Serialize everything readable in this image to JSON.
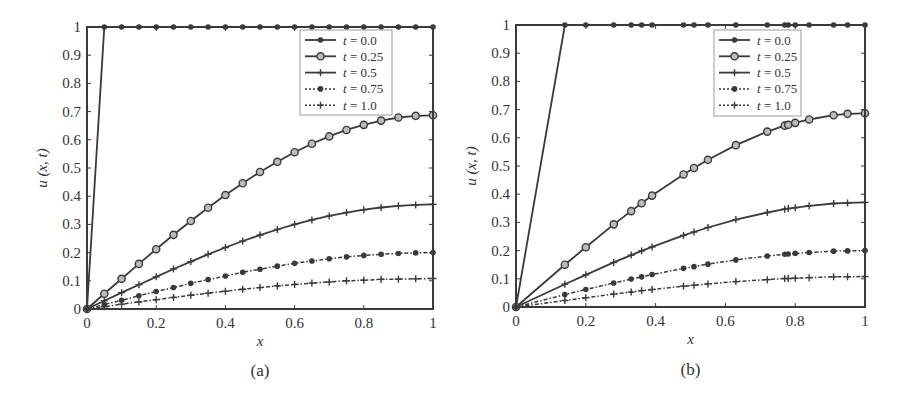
{
  "chart_data": [
    {
      "type": "line",
      "panel": "a",
      "caption": "(a)",
      "xlabel": "x",
      "ylabel": "u (x, t)",
      "xlim": [
        0,
        1
      ],
      "ylim": [
        0,
        1
      ],
      "xticks": [
        "0",
        "0.2",
        "0.4",
        "0.6",
        "0.8",
        "1"
      ],
      "yticks": [
        "0",
        "0.1",
        "0.2",
        "0.3",
        "0.4",
        "0.5",
        "0.6",
        "0.7",
        "0.8",
        "0.9",
        "1"
      ],
      "grid": false,
      "legend_position": "upper right",
      "series": [
        {
          "name": "t = 0.0",
          "style": "solid",
          "marker": "dot",
          "x": [
            0,
            0.05,
            0.1,
            0.15,
            0.2,
            0.25,
            0.3,
            0.35,
            0.4,
            0.45,
            0.5,
            0.55,
            0.6,
            0.65,
            0.7,
            0.75,
            0.8,
            0.85,
            0.9,
            0.95,
            1
          ],
          "values": [
            0,
            1,
            1,
            1,
            1,
            1,
            1,
            1,
            1,
            1,
            1,
            1,
            1,
            1,
            1,
            1,
            1,
            1,
            1,
            1,
            1
          ]
        },
        {
          "name": "t = 0.25",
          "style": "solid",
          "marker": "circle",
          "x": [
            0,
            0.05,
            0.1,
            0.15,
            0.2,
            0.25,
            0.3,
            0.35,
            0.4,
            0.45,
            0.5,
            0.55,
            0.6,
            0.65,
            0.7,
            0.75,
            0.8,
            0.85,
            0.9,
            0.95,
            1
          ],
          "values": [
            0,
            0.054,
            0.107,
            0.16,
            0.212,
            0.263,
            0.312,
            0.359,
            0.404,
            0.446,
            0.486,
            0.522,
            0.556,
            0.586,
            0.612,
            0.635,
            0.653,
            0.668,
            0.679,
            0.685,
            0.687
          ]
        },
        {
          "name": "t = 0.5",
          "style": "solid",
          "marker": "plus",
          "x": [
            0,
            0.05,
            0.1,
            0.15,
            0.2,
            0.25,
            0.3,
            0.35,
            0.4,
            0.45,
            0.5,
            0.55,
            0.6,
            0.65,
            0.7,
            0.75,
            0.8,
            0.85,
            0.9,
            0.95,
            1
          ],
          "values": [
            0,
            0.029,
            0.058,
            0.086,
            0.114,
            0.142,
            0.168,
            0.194,
            0.218,
            0.241,
            0.262,
            0.282,
            0.3,
            0.316,
            0.33,
            0.342,
            0.352,
            0.36,
            0.366,
            0.369,
            0.371
          ]
        },
        {
          "name": "t = 0.75",
          "style": "dashdot",
          "marker": "dot",
          "x": [
            0,
            0.05,
            0.1,
            0.15,
            0.2,
            0.25,
            0.3,
            0.35,
            0.4,
            0.45,
            0.5,
            0.55,
            0.6,
            0.65,
            0.7,
            0.75,
            0.8,
            0.85,
            0.9,
            0.95,
            1
          ],
          "values": [
            0,
            0.016,
            0.031,
            0.047,
            0.062,
            0.076,
            0.091,
            0.104,
            0.117,
            0.13,
            0.141,
            0.152,
            0.162,
            0.17,
            0.178,
            0.185,
            0.19,
            0.194,
            0.197,
            0.199,
            0.2
          ]
        },
        {
          "name": "t = 1.0",
          "style": "dashdot",
          "marker": "plus",
          "x": [
            0,
            0.05,
            0.1,
            0.15,
            0.2,
            0.25,
            0.3,
            0.35,
            0.4,
            0.45,
            0.5,
            0.55,
            0.6,
            0.65,
            0.7,
            0.75,
            0.8,
            0.85,
            0.9,
            0.95,
            1
          ],
          "values": [
            0,
            0.008,
            0.017,
            0.025,
            0.033,
            0.041,
            0.049,
            0.056,
            0.063,
            0.07,
            0.076,
            0.082,
            0.087,
            0.092,
            0.096,
            0.1,
            0.102,
            0.105,
            0.106,
            0.107,
            0.108
          ]
        }
      ]
    },
    {
      "type": "line",
      "panel": "b",
      "caption": "(b)",
      "xlabel": "x",
      "ylabel": "u (x, t)",
      "xlim": [
        0,
        1
      ],
      "ylim": [
        0,
        1
      ],
      "xticks": [
        "0",
        "0.2",
        "0.4",
        "0.6",
        "0.8",
        "1"
      ],
      "yticks": [
        "0",
        "0.1",
        "0.2",
        "0.3",
        "0.4",
        "0.5",
        "0.6",
        "0.7",
        "0.8",
        "0.9",
        "1"
      ],
      "grid": false,
      "legend_position": "upper right",
      "series": [
        {
          "name": "t = 0.0",
          "style": "solid",
          "marker": "dot",
          "x": [
            0,
            0.14,
            0.2,
            0.28,
            0.33,
            0.36,
            0.39,
            0.48,
            0.51,
            0.55,
            0.63,
            0.72,
            0.77,
            0.78,
            0.8,
            0.84,
            0.91,
            0.95,
            1
          ],
          "values": [
            0,
            1,
            1,
            1,
            1,
            1,
            1,
            1,
            1,
            1,
            1,
            1,
            1,
            1,
            1,
            1,
            1,
            1,
            1
          ]
        },
        {
          "name": "t = 0.25",
          "style": "solid",
          "marker": "circle",
          "x": [
            0,
            0.14,
            0.2,
            0.28,
            0.33,
            0.36,
            0.39,
            0.48,
            0.51,
            0.55,
            0.63,
            0.72,
            0.77,
            0.78,
            0.8,
            0.84,
            0.91,
            0.95,
            1
          ],
          "values": [
            0,
            0.15,
            0.212,
            0.293,
            0.34,
            0.368,
            0.395,
            0.47,
            0.493,
            0.522,
            0.574,
            0.622,
            0.643,
            0.646,
            0.653,
            0.665,
            0.68,
            0.685,
            0.687
          ]
        },
        {
          "name": "t = 0.5",
          "style": "solid",
          "marker": "plus",
          "x": [
            0,
            0.14,
            0.2,
            0.28,
            0.33,
            0.36,
            0.39,
            0.48,
            0.51,
            0.55,
            0.63,
            0.72,
            0.77,
            0.78,
            0.8,
            0.84,
            0.91,
            0.95,
            1
          ],
          "values": [
            0,
            0.081,
            0.114,
            0.158,
            0.184,
            0.199,
            0.213,
            0.254,
            0.266,
            0.282,
            0.31,
            0.335,
            0.347,
            0.349,
            0.352,
            0.359,
            0.367,
            0.369,
            0.371
          ]
        },
        {
          "name": "t = 0.75",
          "style": "dashdot",
          "marker": "dot",
          "x": [
            0,
            0.14,
            0.2,
            0.28,
            0.33,
            0.36,
            0.39,
            0.48,
            0.51,
            0.55,
            0.63,
            0.72,
            0.77,
            0.78,
            0.8,
            0.84,
            0.91,
            0.95,
            1
          ],
          "values": [
            0,
            0.044,
            0.062,
            0.085,
            0.099,
            0.107,
            0.115,
            0.137,
            0.143,
            0.152,
            0.167,
            0.181,
            0.187,
            0.188,
            0.19,
            0.193,
            0.198,
            0.199,
            0.2
          ]
        },
        {
          "name": "t = 1.0",
          "style": "dashdot",
          "marker": "plus",
          "x": [
            0,
            0.14,
            0.2,
            0.28,
            0.33,
            0.36,
            0.39,
            0.48,
            0.51,
            0.55,
            0.63,
            0.72,
            0.77,
            0.78,
            0.8,
            0.84,
            0.91,
            0.95,
            1
          ],
          "values": [
            0,
            0.023,
            0.033,
            0.046,
            0.053,
            0.058,
            0.062,
            0.074,
            0.077,
            0.082,
            0.09,
            0.097,
            0.101,
            0.101,
            0.102,
            0.104,
            0.107,
            0.107,
            0.108
          ]
        }
      ]
    }
  ],
  "colors": {
    "line": "#3a3a3a",
    "text": "#333333",
    "legend_border": "#999999"
  }
}
